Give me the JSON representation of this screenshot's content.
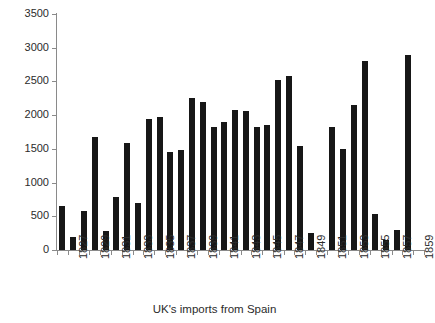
{
  "chart_data": {
    "type": "bar",
    "title": "",
    "xlabel": "UK's imports from Spain",
    "ylabel": "",
    "ylim": [
      0,
      3500
    ],
    "ytick_values": [
      0,
      500,
      1000,
      1500,
      2000,
      2500,
      3000,
      3500
    ],
    "ytick_labels": [
      "0",
      "500",
      "1000",
      "1500",
      "2000",
      "2500",
      "3000",
      "3500"
    ],
    "grid": false,
    "legend": null,
    "xtick_labels_shown": [
      "1827",
      "1829",
      "1831",
      "1833",
      "1835",
      "1837",
      "1839",
      "1841",
      "1843",
      "1845",
      "1847",
      "1849",
      "1851",
      "1853",
      "1855",
      "1857",
      "1859"
    ],
    "categories": [
      "1826",
      "1827",
      "1828",
      "1829",
      "1830",
      "1831",
      "1832",
      "1833",
      "1834",
      "1835",
      "1836",
      "1837",
      "1838",
      "1839",
      "1840",
      "1841",
      "1842",
      "1843",
      "1844",
      "1845",
      "1846",
      "1847",
      "1848",
      "1849",
      "1850",
      "1851",
      "1852",
      "1853",
      "1854",
      "1855",
      "1856",
      "1857",
      "1858",
      "1859"
    ],
    "values": [
      650,
      200,
      580,
      1680,
      280,
      780,
      1580,
      700,
      1950,
      1970,
      1450,
      1480,
      2250,
      2200,
      1820,
      1900,
      2080,
      2060,
      1820,
      1850,
      2520,
      2580,
      1550,
      250,
      null,
      1830,
      1500,
      2150,
      2800,
      530,
      150,
      300,
      2890,
      null
    ],
    "bar_color": "#171717",
    "axis_color": "#8a8a8a",
    "text_color": "#2b2b2b"
  },
  "cropped_title_remnant": ""
}
